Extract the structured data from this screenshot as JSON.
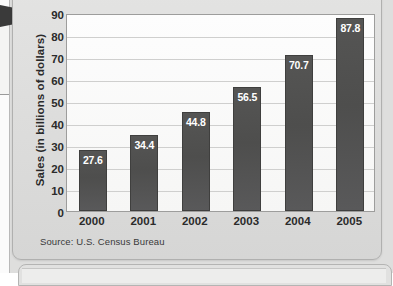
{
  "figure": {
    "source_note": "Source: U.S. Census Bureau"
  },
  "chart_data": {
    "type": "bar",
    "title": "",
    "xlabel": "",
    "ylabel": "Sales (in billions of dollars)",
    "categories": [
      "2000",
      "2001",
      "2002",
      "2003",
      "2004",
      "2005"
    ],
    "values": [
      27.6,
      34.4,
      44.8,
      56.5,
      70.7,
      87.8
    ],
    "value_labels": [
      "27.6",
      "34.4",
      "44.8",
      "56.5",
      "70.7",
      "87.8"
    ],
    "ylim": [
      0,
      90
    ],
    "yticks": [
      0,
      10,
      20,
      30,
      40,
      50,
      60,
      70,
      80,
      90
    ],
    "ytick_labels": [
      "0",
      "10",
      "20",
      "30",
      "40",
      "50",
      "60",
      "70",
      "80",
      "90"
    ],
    "grid": true,
    "legend": null,
    "bar_color": "#525251",
    "value_label_color": "#ffffff",
    "plot_bg_color": "#fbfbfa",
    "gridline_color": "#cfcfce",
    "panel_bg_color": "#dedede"
  }
}
